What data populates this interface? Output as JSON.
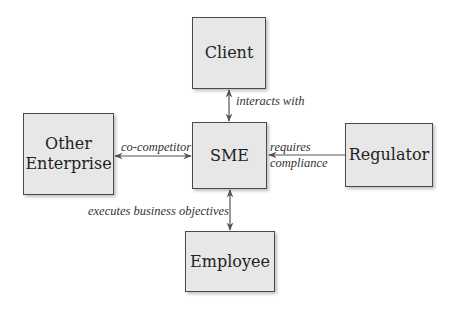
{
  "diagram": {
    "type": "stakeholder-relationship",
    "center": "SME",
    "nodes": {
      "client": {
        "label": "Client"
      },
      "sme": {
        "label": "SME"
      },
      "other_enterprise": {
        "label_line1": "Other",
        "label_line2": "Enterprise"
      },
      "regulator": {
        "label": "Regulator"
      },
      "employee": {
        "label": "Employee"
      }
    },
    "edges": {
      "client_sme": {
        "label": "interacts with",
        "direction": "bidirectional"
      },
      "other_sme": {
        "label": "co-competitor",
        "direction": "bidirectional"
      },
      "regulator_sme": {
        "label_line1": "requires",
        "label_line2": "compliance",
        "direction": "regulator-to-sme"
      },
      "sme_employee": {
        "label": "executes business objectives",
        "direction": "bidirectional"
      }
    },
    "colors": {
      "node_fill": "#e7e7e7",
      "node_border": "#4a4a4a",
      "edge": "#555555",
      "background": "#ffffff"
    }
  }
}
